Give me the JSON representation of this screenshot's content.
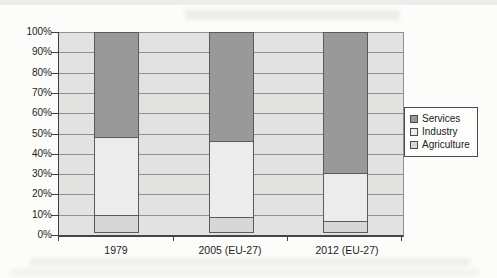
{
  "chart_data": {
    "type": "bar",
    "stacked": true,
    "title": "",
    "categories": [
      "1979",
      "2005 (EU-27)",
      "2012 (EU-27)"
    ],
    "series": [
      {
        "name": "Services",
        "color": "#999999",
        "values": [
          52,
          54,
          70
        ]
      },
      {
        "name": "Industry",
        "color": "#ececec",
        "values": [
          39,
          38,
          24
        ]
      },
      {
        "name": "Agriculture",
        "color": "#d7d7d7",
        "values": [
          9,
          8,
          6
        ]
      }
    ],
    "y_ticks": [
      "0%",
      "10%",
      "20%",
      "30%",
      "40%",
      "50%",
      "60%",
      "70%",
      "80%",
      "90%",
      "100%"
    ],
    "ylim": [
      0,
      100
    ],
    "grid": "horizontal",
    "legend_position": "right",
    "plot_background": "#e2e2e1",
    "gridline_color": "#909090",
    "segment_border_color": "#5a5a5a"
  }
}
